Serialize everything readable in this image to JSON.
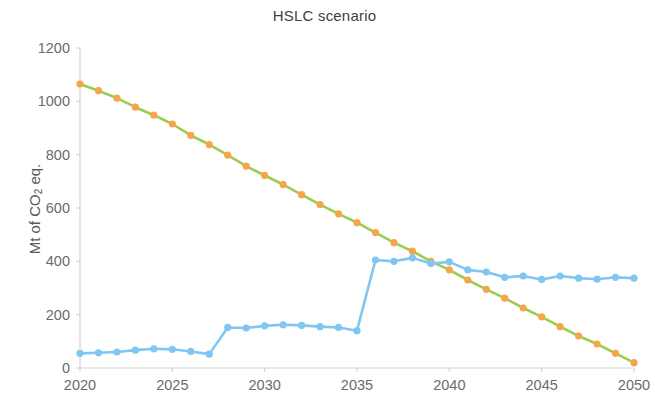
{
  "chart_data": {
    "type": "line",
    "title": "HSLC scenario",
    "xlabel": "",
    "ylabel": "Mt of CO2 eq.",
    "ylabel_parts": {
      "pre": "Mt of CO",
      "sub": "2",
      "post": " eq."
    },
    "xlim": [
      2020,
      2050
    ],
    "ylim": [
      0,
      1200
    ],
    "x_ticks": [
      2020,
      2025,
      2030,
      2035,
      2040,
      2045,
      2050
    ],
    "x_tick_labels": [
      "2020",
      "2025",
      "2030",
      "2035",
      "2040",
      "2045",
      "2050"
    ],
    "y_ticks": [
      0,
      200,
      400,
      600,
      800,
      1000,
      1200
    ],
    "y_tick_labels": [
      "0",
      "200",
      "400",
      "600",
      "800",
      "1000",
      "1200"
    ],
    "grid": false,
    "legend": "none",
    "marker": "circle",
    "x": [
      2020,
      2021,
      2022,
      2023,
      2024,
      2025,
      2026,
      2027,
      2028,
      2029,
      2030,
      2031,
      2032,
      2033,
      2034,
      2035,
      2036,
      2037,
      2038,
      2039,
      2040,
      2041,
      2042,
      2043,
      2044,
      2045,
      2046,
      2047,
      2048,
      2049,
      2050
    ],
    "series": [
      {
        "name": "declining-emissions",
        "line_color": "#9ACD4E",
        "marker_color": "#F5A64B",
        "values": [
          1065,
          1040,
          1012,
          978,
          948,
          915,
          872,
          838,
          798,
          757,
          722,
          688,
          650,
          613,
          578,
          545,
          508,
          470,
          438,
          400,
          368,
          330,
          295,
          262,
          225,
          192,
          155,
          120,
          90,
          55,
          20
        ]
      },
      {
        "name": "low-carbon-supply",
        "line_color": "#7FC7F0",
        "marker_color": "#7FC7F0",
        "values": [
          55,
          57,
          60,
          67,
          72,
          70,
          62,
          52,
          152,
          150,
          158,
          162,
          160,
          155,
          152,
          140,
          405,
          400,
          413,
          392,
          398,
          368,
          360,
          340,
          345,
          332,
          345,
          337,
          333,
          340,
          337
        ]
      }
    ],
    "annotations": []
  }
}
